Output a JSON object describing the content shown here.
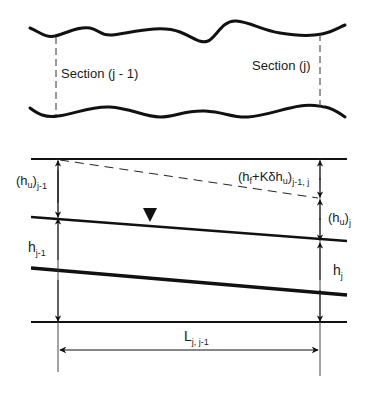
{
  "diagram": {
    "type": "open-channel energy profile between two cross sections",
    "plan_view": {
      "section_left_label": "Section (j - 1)",
      "section_right_label": "Section (j)"
    },
    "profile_view": {
      "labels": {
        "hu_left_main": "(h",
        "hu_left_sub_u": "u",
        "hu_left_close": ")",
        "hu_left_sub": "j-1",
        "hf_open": "(h",
        "hf_sub_f": "f",
        "hf_mid": "+Kδh",
        "hf_sub_u": "u",
        "hf_close": ")",
        "hf_sub": "j-1, j",
        "hu_right_open": "(h",
        "hu_right_sub_u": "u",
        "hu_right_close": ")",
        "hu_right_sub": "j",
        "h_left": "h",
        "h_left_sub": "j-1",
        "h_right": "h",
        "h_right_sub": "j",
        "length": "L",
        "length_sub": "j, j-1"
      },
      "symbols": {
        "water_surface": "inverted-triangle"
      }
    },
    "colors": {
      "stroke": "#111111",
      "thin": "#333333"
    }
  }
}
